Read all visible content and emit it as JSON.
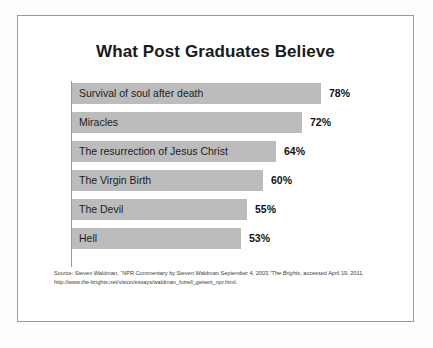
{
  "card": {
    "title": "What Post Graduates Believe"
  },
  "chart_data": {
    "type": "bar",
    "orientation": "horizontal",
    "title": "What Post Graduates Believe",
    "xlabel": "",
    "ylabel": "",
    "xlim": [
      0,
      100
    ],
    "grid": false,
    "legend": false,
    "value_suffix": "%",
    "categories": [
      "Survival of soul after death",
      "Miracles",
      "The resurrection of Jesus Christ",
      "The Virgin Birth",
      "The Devil",
      "Hell"
    ],
    "values": [
      78,
      72,
      64,
      60,
      55,
      53
    ],
    "value_labels": [
      "78%",
      "72%",
      "64%",
      "60%",
      "55%",
      "53%"
    ],
    "bar_color": "#bcbcbc"
  },
  "source": {
    "line1_part1": "Source: Steven Waldman, “NPR Commentary by Steven Waldman September 4, 2003,”",
    "line1_italic": "The Brights",
    "line1_part2": ",",
    "line2": "accessed April 19, 2011, http://www.the-brights.net/vision/essays/waldman_futrell_geisert_npr.html."
  }
}
